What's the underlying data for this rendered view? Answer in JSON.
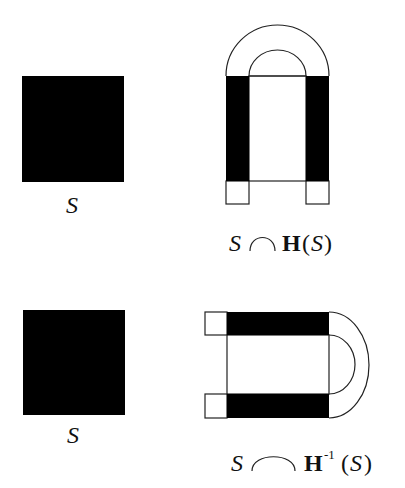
{
  "colors": {
    "fill": "#000000",
    "stroke": "#222222",
    "background": "#ffffff"
  },
  "panels": [
    {
      "square_label": "S",
      "caption": {
        "set": "S",
        "operator": "intersection",
        "map": "H",
        "superscript": "",
        "open_paren": "(",
        "arg": "S",
        "close_paren": ")"
      }
    },
    {
      "square_label": "S",
      "caption": {
        "set": "S",
        "operator": "intersection",
        "map": "H",
        "superscript": "-1",
        "open_paren": "(",
        "arg": "S",
        "close_paren": ")"
      }
    }
  ]
}
